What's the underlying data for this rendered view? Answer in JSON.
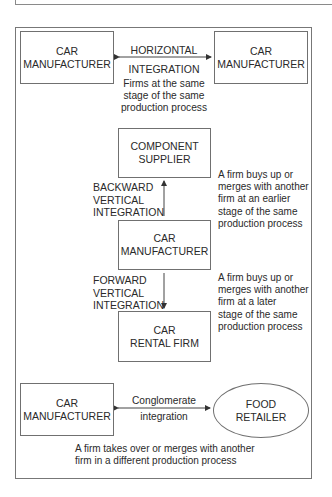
{
  "diagram": {
    "horizontal": {
      "left_box": {
        "line1": "CAR",
        "line2": "MANUFACTURER"
      },
      "right_box": {
        "line1": "CAR",
        "line2": "MANUFACTURER"
      },
      "arrow_label": {
        "line1": "HORIZONTAL",
        "line2": "INTEGRATION"
      },
      "description": [
        "Firms at the same",
        "stage of the same",
        "production process"
      ]
    },
    "vertical": {
      "top_box": {
        "line1": "COMPONENT",
        "line2": "SUPPLIER"
      },
      "middle_box": {
        "line1": "CAR",
        "line2": "MANUFACTURER"
      },
      "bottom_box": {
        "line1": "CAR",
        "line2": "RENTAL FIRM"
      },
      "backward_label": [
        "BACKWARD",
        "VERTICAL",
        "INTEGRATION"
      ],
      "backward_description": [
        "A firm buys up or",
        "merges with another",
        "firm at an earlier",
        "stage of the same",
        "production process"
      ],
      "forward_label": [
        "FORWARD",
        "VERTICAL",
        "INTEGRATION"
      ],
      "forward_description": [
        "A firm buys up or",
        "merges with another",
        "firm at a later",
        "stage of the same",
        "production process"
      ]
    },
    "conglomerate": {
      "left_box": {
        "line1": "CAR",
        "line2": "MANUFACTURER"
      },
      "right_ellipse": {
        "line1": "FOOD",
        "line2": "RETAILER"
      },
      "arrow_label": {
        "line1": "Conglomerate",
        "line2": "integration"
      },
      "description": [
        "A firm takes over or merges with another",
        "firm in a different production process"
      ]
    },
    "colors": {
      "line": "#707070",
      "text": "#2a2a2a",
      "background": "#ffffff"
    }
  }
}
